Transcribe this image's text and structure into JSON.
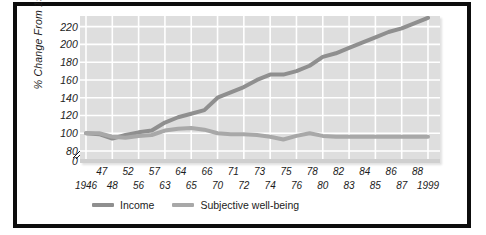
{
  "chart_data": {
    "type": "line",
    "title": "",
    "subtitle": "",
    "xlabel": "",
    "ylabel": "% Change From 1946",
    "ylim": [
      80,
      232
    ],
    "yticks": [
      0,
      80,
      100,
      120,
      140,
      160,
      180,
      200,
      220
    ],
    "ytick_labels": [
      "0",
      "80",
      "100",
      "120",
      "140",
      "160",
      "180",
      "200",
      "220"
    ],
    "axis_break": true,
    "axis_break_between": [
      0,
      80
    ],
    "grid": true,
    "grid_color": "#ffffff",
    "plot_background": "#dedede",
    "legend_position": "below-axis-left",
    "x_label_rows": {
      "top": [
        "47",
        "52",
        "57",
        "64",
        "66",
        "71",
        "73",
        "75",
        "78",
        "82",
        "84",
        "86",
        "88"
      ],
      "bottom": [
        "1946",
        "48",
        "56",
        "63",
        "65",
        "70",
        "72",
        "74",
        "76",
        "80",
        "83",
        "85",
        "87",
        "1999"
      ]
    },
    "x": [
      1946,
      1947,
      1948,
      1952,
      1956,
      1957,
      1963,
      1964,
      1965,
      1966,
      1970,
      1971,
      1972,
      1973,
      1974,
      1975,
      1976,
      1978,
      1980,
      1982,
      1983,
      1984,
      1985,
      1986,
      187,
      1988,
      1999
    ],
    "series": [
      {
        "name": "Income",
        "color": "#8f8f8f",
        "values": [
          100,
          99,
          94,
          98,
          101,
          103,
          112,
          118,
          122,
          126,
          140,
          146,
          152,
          160,
          166,
          166,
          170,
          176,
          186,
          190,
          196,
          202,
          208,
          214,
          218,
          224,
          230
        ]
      },
      {
        "name": "Subjective well-being",
        "color": "#a8a8a8",
        "values": [
          100,
          100,
          96,
          95,
          97,
          98,
          103,
          105,
          106,
          104,
          100,
          99,
          99,
          98,
          96,
          93,
          97,
          100,
          97,
          96,
          96,
          96,
          96,
          96,
          96,
          96,
          96
        ]
      }
    ]
  },
  "y_axis": {
    "title": "% Change From 1946",
    "ticks": [
      "220",
      "200",
      "180",
      "160",
      "140",
      "120",
      "100",
      "80",
      "0"
    ]
  },
  "x_axis": {
    "top_row": [
      "47",
      "52",
      "57",
      "64",
      "66",
      "71",
      "73",
      "75",
      "78",
      "82",
      "84",
      "86",
      "88"
    ],
    "bottom_row": [
      "1946",
      "48",
      "56",
      "63",
      "65",
      "70",
      "72",
      "74",
      "76",
      "80",
      "83",
      "85",
      "87",
      "1999"
    ]
  },
  "legend": {
    "items": [
      {
        "label": "Income",
        "color": "#8f8f8f"
      },
      {
        "label": "Subjective well-being",
        "color": "#a8a8a8"
      }
    ]
  }
}
